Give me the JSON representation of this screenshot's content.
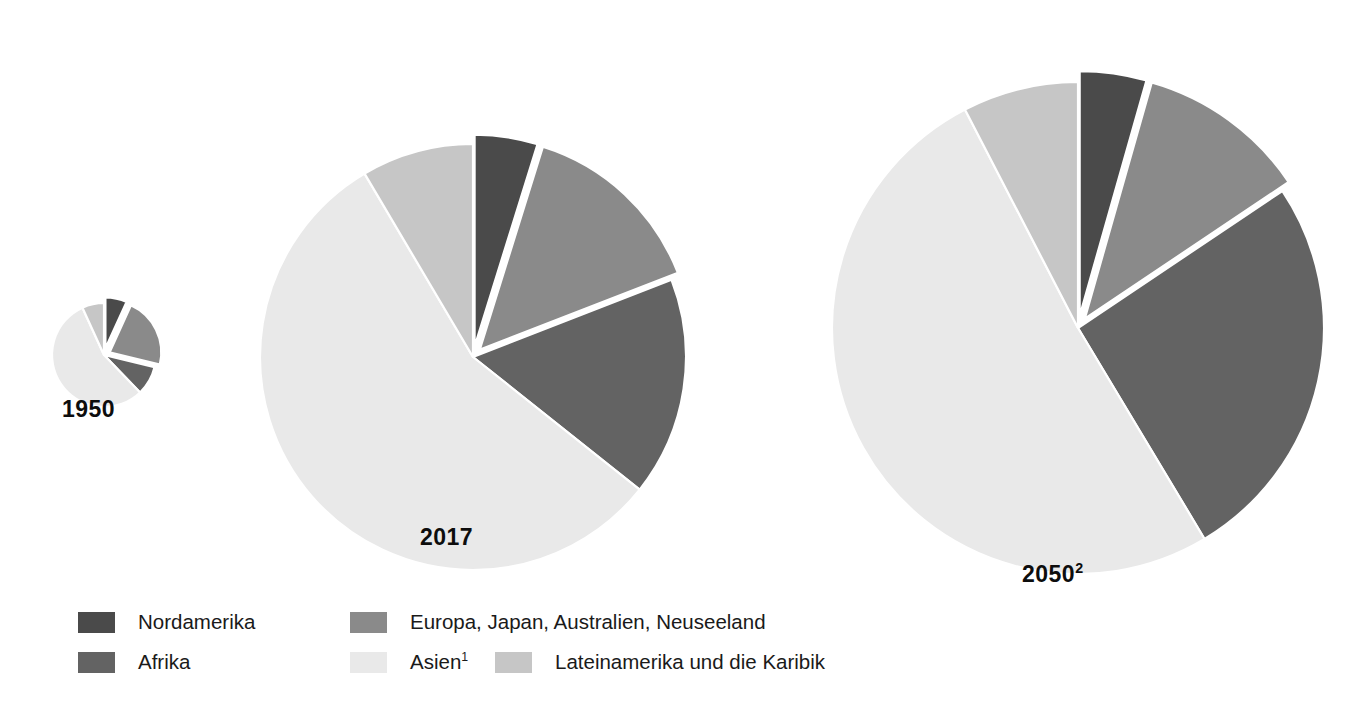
{
  "chart_data": {
    "type": "pie",
    "title": "",
    "subtitle": "",
    "xlabel": "",
    "ylabel": "",
    "legend_position": "bottom",
    "grid": false,
    "units": "percent of world population",
    "categories": [
      "Nordamerika",
      "Europa, Japan, Australien, Neuseeland",
      "Afrika",
      "Asien",
      "Lateinamerika und die Karibik"
    ],
    "colors": {
      "nordamerika": "#4a4a4a",
      "europa": "#8a8a8a",
      "afrika": "#636363",
      "asien": "#e9e9e9",
      "lateinamerika": "#c6c6c6",
      "background": "#ffffff",
      "separator": "#ffffff",
      "text": "#111111"
    },
    "pies": [
      {
        "id": "pie-1950",
        "label": "1950",
        "label_sup": "",
        "center_x": 104,
        "center_y": 355,
        "radius": 52,
        "slices": [
          {
            "name": "Nordamerika",
            "key": "nordamerika",
            "value": 6.8,
            "exploded": true
          },
          {
            "name": "Europa, Japan, Australien, Neuseeland",
            "key": "europa",
            "value": 22.0,
            "exploded": true
          },
          {
            "name": "Afrika",
            "key": "afrika",
            "value": 9.0,
            "exploded": false
          },
          {
            "name": "Asien",
            "key": "asien",
            "value": 55.4,
            "exploded": false
          },
          {
            "name": "Lateinamerika und die Karibik",
            "key": "lateinamerika",
            "value": 6.8,
            "exploded": false
          }
        ]
      },
      {
        "id": "pie-2017",
        "label": "2017",
        "label_sup": "",
        "center_x": 473,
        "center_y": 357,
        "radius": 213,
        "slices": [
          {
            "name": "Nordamerika",
            "key": "nordamerika",
            "value": 4.8,
            "exploded": true
          },
          {
            "name": "Europa, Japan, Australien, Neuseeland",
            "key": "europa",
            "value": 14.3,
            "exploded": true
          },
          {
            "name": "Afrika",
            "key": "afrika",
            "value": 16.6,
            "exploded": false
          },
          {
            "name": "Asien",
            "key": "asien",
            "value": 55.8,
            "exploded": false
          },
          {
            "name": "Lateinamerika und die Karibik",
            "key": "lateinamerika",
            "value": 8.5,
            "exploded": false
          }
        ]
      },
      {
        "id": "pie-2050",
        "label": "2050",
        "label_sup": "2",
        "center_x": 1078,
        "center_y": 328,
        "radius": 246,
        "slices": [
          {
            "name": "Nordamerika",
            "key": "nordamerika",
            "value": 4.4,
            "exploded": true
          },
          {
            "name": "Europa, Japan, Australien, Neuseeland",
            "key": "europa",
            "value": 11.2,
            "exploded": true
          },
          {
            "name": "Afrika",
            "key": "afrika",
            "value": 25.8,
            "exploded": false
          },
          {
            "name": "Asien",
            "key": "asien",
            "value": 51.0,
            "exploded": false
          },
          {
            "name": "Lateinamerika und die Karibik",
            "key": "lateinamerika",
            "value": 7.6,
            "exploded": false
          }
        ]
      }
    ]
  },
  "year_labels": {
    "y1950": "1950",
    "y2017": "2017",
    "y2050": "2050",
    "y2050_sup": "2"
  },
  "legend": {
    "rows": [
      [
        {
          "label": "Nordamerika",
          "sup": "",
          "key": "nordamerika",
          "swatch": "legend-swatch-nordamerika"
        },
        {
          "label": "Europa, Japan, Australien, Neuseeland",
          "sup": "",
          "key": "europa",
          "swatch": "legend-swatch-europa"
        }
      ],
      [
        {
          "label": "Afrika",
          "sup": "",
          "key": "afrika",
          "swatch": "legend-swatch-afrika"
        },
        {
          "label": "Asien",
          "sup": "1",
          "key": "asien",
          "swatch": "legend-swatch-asien"
        },
        {
          "label": "Lateinamerika und die Karibik",
          "sup": "",
          "key": "lateinamerika",
          "swatch": "legend-swatch-lateinamerika"
        }
      ]
    ]
  },
  "footer": {
    "cut_text": ""
  }
}
